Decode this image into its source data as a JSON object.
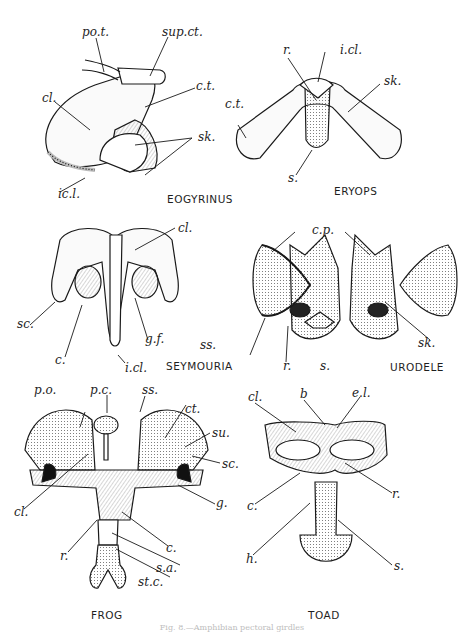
{
  "figure": {
    "caption": "Fig. 8.—Amphibian pectoral girdles",
    "panels": [
      {
        "name": "EOGYRINUS",
        "labels": [
          "po.t.",
          "sup.ct.",
          "c.t.",
          "cl.",
          "sk.",
          "ic.l."
        ]
      },
      {
        "name": "ERYOPS",
        "labels": [
          "r.",
          "i.cl.",
          "sk.",
          "c.t.",
          "s."
        ]
      },
      {
        "name": "SEYMOURIA",
        "labels": [
          "cl.",
          "sc.",
          "g.f.",
          "c.",
          "i.cl."
        ]
      },
      {
        "name": "URODELE",
        "labels": [
          "c.p.",
          "ss.",
          "r.",
          "s.",
          "sk."
        ]
      },
      {
        "name": "FROG",
        "labels": [
          "p.o.",
          "p.c.",
          "ss.",
          "ct.",
          "su.",
          "sc.",
          "g.",
          "cl.",
          "r.",
          "c.",
          "s.a.",
          "st.c."
        ]
      },
      {
        "name": "TOAD",
        "labels": [
          "cl.",
          "b",
          "e.l.",
          "r.",
          "c.",
          "h.",
          "s."
        ]
      }
    ]
  }
}
